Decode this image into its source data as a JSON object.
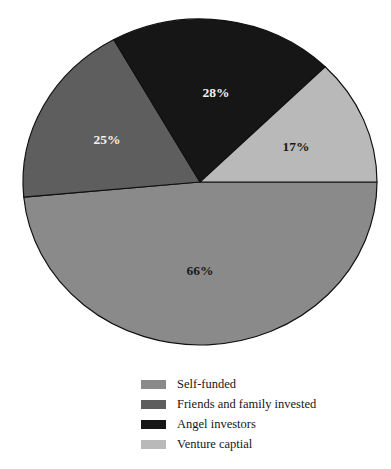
{
  "chart_data": {
    "type": "pie",
    "title": "",
    "subtitle": "",
    "xlabel": "",
    "ylabel": "",
    "grid": false,
    "legend_position": "bottom",
    "total_percent": 136,
    "note": "Multi-response survey: slice percentages sum to 136%",
    "categories": [
      "Self-funded",
      "Friends and family invested",
      "Angel investors",
      "Venture captial"
    ],
    "values": [
      66,
      25,
      28,
      17
    ],
    "labels": [
      "66%",
      "25%",
      "28%",
      "17%"
    ],
    "colors": [
      "#8a8a8a",
      "#5e5e5e",
      "#161616",
      "#b9b9b9"
    ],
    "label_colors": [
      "dark",
      "light",
      "light",
      "dark"
    ],
    "slices": [
      {
        "name": "Self-funded",
        "value": 66,
        "label": "66%",
        "color": "#8a8a8a",
        "label_color": "dark",
        "start_angle": 0,
        "end_angle": 174.7,
        "label_x": 200,
        "label_y": 272
      },
      {
        "name": "Friends and family invested",
        "value": 25,
        "label": "25%",
        "color": "#5e5e5e",
        "label_color": "light",
        "start_angle": 174.7,
        "end_angle": 240.9,
        "label_x": 107,
        "label_y": 141
      },
      {
        "name": "Angel investors",
        "value": 28,
        "label": "28%",
        "color": "#161616",
        "label_color": "light",
        "start_angle": 240.9,
        "end_angle": 315.0,
        "label_x": 216,
        "label_y": 94
      },
      {
        "name": "Venture captial",
        "value": 17,
        "label": "17%",
        "color": "#b9b9b9",
        "label_color": "dark",
        "start_angle": 315.0,
        "end_angle": 360,
        "label_x": 296,
        "label_y": 148
      }
    ],
    "geometry": {
      "cx": 200,
      "cy": 182,
      "rx": 177,
      "ry": 163,
      "stroke": "#111111",
      "stroke_width": 1.2
    }
  },
  "legend": {
    "items": [
      {
        "label": "Self-funded",
        "color": "#8a8a8a"
      },
      {
        "label": "Friends and family invested",
        "color": "#5e5e5e"
      },
      {
        "label": "Angel investors",
        "color": "#161616"
      },
      {
        "label": "Venture captial",
        "color": "#b9b9b9"
      }
    ]
  }
}
